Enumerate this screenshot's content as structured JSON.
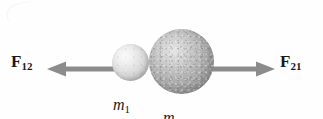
{
  "figure": {
    "kind": "physics-free-body-diagram",
    "background_color": "#fefefe"
  },
  "forces": {
    "left": {
      "symbol": "F",
      "subscript": "12",
      "direction": "left",
      "color": "#8c8c8c"
    },
    "right": {
      "symbol": "F",
      "subscript": "21",
      "direction": "right",
      "color": "#8c8c8c"
    }
  },
  "masses": {
    "small": {
      "symbol": "m",
      "subscript": "1",
      "fill_color": "#d8d8d8"
    },
    "large": {
      "symbol": "m",
      "subscript": "2",
      "fill_color": "#b8b8b8"
    }
  }
}
